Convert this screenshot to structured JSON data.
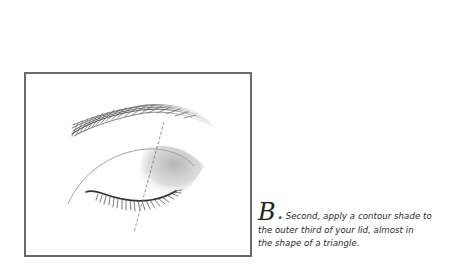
{
  "illustration": {
    "name": "closed-eye-contour-diagram",
    "frame_color": "#6a6a6a",
    "shade_color": "#b8b8b8",
    "guide_line_style": "dashed",
    "elements": [
      "eyebrow",
      "crease-line",
      "lid-line",
      "eyelashes",
      "contour-shade",
      "guide-line"
    ]
  },
  "caption": {
    "step_letter": "B",
    "step_punct": ".",
    "lines": [
      "Second, apply a contour shade to",
      "the outer third of your lid, almost in",
      "the shape of a triangle."
    ]
  }
}
